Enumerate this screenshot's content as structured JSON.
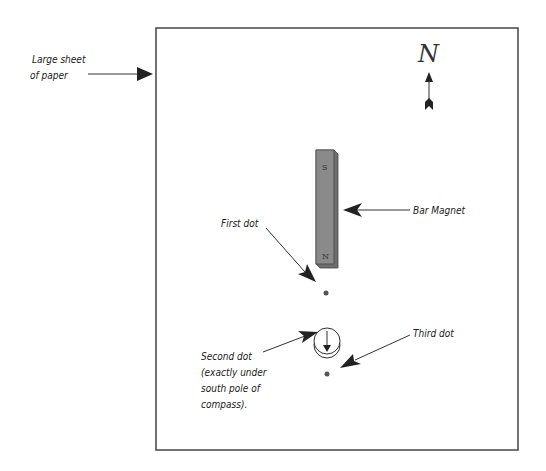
{
  "diagram": {
    "labels": {
      "paper_line1": "Large sheet",
      "paper_line2": "of paper",
      "north": "N",
      "bar_magnet": "Bar Magnet",
      "first_dot": "First dot",
      "second_dot_line1": "Second dot",
      "second_dot_line2": "(exactly under",
      "second_dot_line3": "south pole of",
      "second_dot_line4": "compass).",
      "third_dot": "Third dot"
    },
    "magnet": {
      "top_pole": "S",
      "bottom_pole": "N",
      "color": "#8a8a8a"
    },
    "colors": {
      "stroke": "#333333",
      "paper": "#ffffff"
    }
  }
}
